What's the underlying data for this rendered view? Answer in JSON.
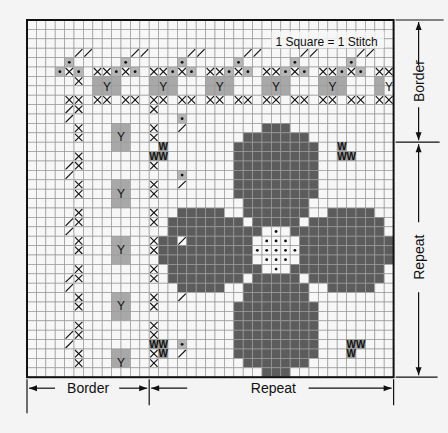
{
  "title": "1 Square = 1 Stitch",
  "labels": {
    "bottom_border": "Border",
    "bottom_repeat": "Repeat",
    "right_border": "Border",
    "right_repeat": "Repeat"
  },
  "symbols": {
    "Y": "Y",
    "W": "W"
  },
  "colors": {
    "background": "#f4f4f4",
    "grid_line": "#9a9a9a",
    "grid_border": "#111111",
    "cell_empty": "#f7f7f7",
    "petal": "#5c5c5c",
    "y_cell": "#a8a8a8",
    "w_cell": "#9a9a9a",
    "dot_cell": "#b5b5b5",
    "ink": "#111111"
  },
  "grid": {
    "x0": 27,
    "y0": 20,
    "cell": 9.4,
    "cols": 39,
    "rows": 38
  },
  "legend": {
    "Y": "light gray cell with Y",
    "W": "gray cell with W",
    "dot": "small dotted square",
    "petal": "dark gray flower petal",
    "center": "white dotted center",
    "x": "cross stitch",
    "slash": "diagonal half stitch"
  }
}
